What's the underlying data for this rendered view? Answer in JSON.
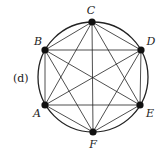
{
  "figure": {
    "tag": "(d)",
    "circle": {
      "cx": 93,
      "cy": 77,
      "r": 55
    },
    "vertices": [
      {
        "id": "A",
        "x": 45,
        "y": 105,
        "lx": 37,
        "ly": 117
      },
      {
        "id": "B",
        "x": 45,
        "y": 50,
        "lx": 38,
        "ly": 45
      },
      {
        "id": "C",
        "x": 92,
        "y": 22,
        "lx": 91,
        "ly": 14
      },
      {
        "id": "D",
        "x": 141,
        "y": 50,
        "lx": 151,
        "ly": 45
      },
      {
        "id": "E",
        "x": 140,
        "y": 105,
        "lx": 150,
        "ly": 117
      },
      {
        "id": "F",
        "x": 93,
        "y": 132,
        "lx": 93,
        "ly": 148
      }
    ],
    "edges": [
      [
        "A",
        "B"
      ],
      [
        "A",
        "C"
      ],
      [
        "A",
        "D"
      ],
      [
        "A",
        "E"
      ],
      [
        "A",
        "F"
      ],
      [
        "B",
        "C"
      ],
      [
        "B",
        "D"
      ],
      [
        "B",
        "E"
      ],
      [
        "B",
        "F"
      ],
      [
        "C",
        "D"
      ],
      [
        "C",
        "E"
      ],
      [
        "C",
        "F"
      ],
      [
        "D",
        "E"
      ],
      [
        "D",
        "F"
      ],
      [
        "E",
        "F"
      ]
    ],
    "colors": {
      "stroke": "#222222",
      "vertex": "#111111"
    }
  }
}
